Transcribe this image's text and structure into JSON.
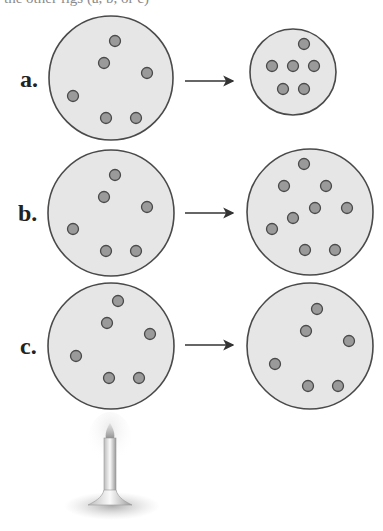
{
  "caption_fragment": "the other figs (a, b, or c)",
  "colors": {
    "container_fill": "#e6e6e6",
    "container_stroke": "#4a4a4a",
    "particle_fill": "#9a9a9a",
    "particle_stroke": "#4a4a4a",
    "arrow": "#333333"
  },
  "rows": [
    {
      "label": "a.",
      "description": "gas compressed into smaller container",
      "before": {
        "cx": 111,
        "cy": 78,
        "r": 62,
        "particles": [
          [
            115,
            41
          ],
          [
            104,
            63
          ],
          [
            147,
            73
          ],
          [
            73,
            96
          ],
          [
            106,
            118
          ],
          [
            136,
            118
          ]
        ]
      },
      "after": {
        "cx": 293,
        "cy": 72,
        "r": 43,
        "particles": [
          [
            304,
            44
          ],
          [
            272,
            66
          ],
          [
            293,
            66
          ],
          [
            314,
            66
          ],
          [
            283,
            89
          ],
          [
            304,
            89
          ]
        ]
      },
      "arrow": {
        "x1": 185,
        "x2": 233,
        "y": 81
      }
    },
    {
      "label": "b.",
      "description": "more gas particles added",
      "before": {
        "cx": 111,
        "cy": 213,
        "r": 63,
        "particles": [
          [
            115,
            175
          ],
          [
            104,
            197
          ],
          [
            147,
            207
          ],
          [
            73,
            229
          ],
          [
            106,
            251
          ],
          [
            136,
            251
          ]
        ]
      },
      "after": {
        "cx": 310,
        "cy": 212,
        "r": 63,
        "particles": [
          [
            304,
            164
          ],
          [
            284,
            186
          ],
          [
            326,
            186
          ],
          [
            315,
            208
          ],
          [
            347,
            208
          ],
          [
            293,
            218
          ],
          [
            272,
            229
          ],
          [
            305,
            250
          ],
          [
            335,
            250
          ]
        ]
      },
      "arrow": {
        "x1": 185,
        "x2": 233,
        "y": 213
      }
    },
    {
      "label": "c.",
      "description": "gas heated by burner",
      "before": {
        "cx": 111,
        "cy": 346,
        "r": 63,
        "particles": [
          [
            118,
            301
          ],
          [
            107,
            323
          ],
          [
            150,
            334
          ],
          [
            76,
            356
          ],
          [
            109,
            378
          ],
          [
            139,
            378
          ]
        ]
      },
      "after": {
        "cx": 310,
        "cy": 346,
        "r": 63,
        "particles": [
          [
            317,
            309
          ],
          [
            306,
            331
          ],
          [
            349,
            341
          ],
          [
            275,
            364
          ],
          [
            308,
            386
          ],
          [
            338,
            386
          ]
        ]
      },
      "arrow": {
        "x1": 185,
        "x2": 233,
        "y": 345
      }
    }
  ],
  "burner": {
    "name": "bunsen-burner",
    "x": 110,
    "flame_top": 423,
    "base_y": 505
  }
}
